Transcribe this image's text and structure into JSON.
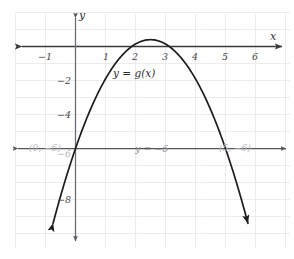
{
  "figure": {
    "background_color": "#ffffff",
    "width": 294,
    "height": 259
  },
  "axes": {
    "x_axis_name": "x",
    "y_axis_name": "y",
    "x_ticks": [
      {
        "value": -1,
        "label": "−1"
      },
      {
        "value": 1,
        "label": "1"
      },
      {
        "value": 2,
        "label": "2"
      },
      {
        "value": 3,
        "label": "3"
      },
      {
        "value": 4,
        "label": "4"
      },
      {
        "value": 5,
        "label": "5"
      },
      {
        "value": 6,
        "label": "6"
      }
    ],
    "y_ticks": [
      {
        "value": -2,
        "label": "−2"
      },
      {
        "value": -4,
        "label": "−4"
      },
      {
        "value": -6,
        "label": "−6"
      },
      {
        "value": -8,
        "label": "−8"
      }
    ],
    "axis_color": "#3a3a3e",
    "grid_color": "#ece8ea"
  },
  "labels": {
    "curve": "y = g(x)",
    "horizontal_line": "y = −6",
    "left_intersection": "(0, −6)",
    "right_intersection": "(5, −6)"
  },
  "chart_data": {
    "type": "line",
    "title": "",
    "xlabel": "x",
    "ylabel": "y",
    "xlim": [
      -1.9,
      7.1
    ],
    "ylim": [
      -10.4,
      1.6
    ],
    "grid": true,
    "legend": "none",
    "series": [
      {
        "name": "y = g(x)",
        "kind": "parabola",
        "equation": "y = -0.96(x - 2.5)^2 + 0.4",
        "vertex": [
          2.5,
          0.4
        ],
        "roots_at_y_minus_6": [
          0,
          5
        ],
        "opens": "down",
        "color": "#1d1d1f",
        "arrow_ends": "both",
        "points": [
          {
            "x": 0.0,
            "y": -6.0
          },
          {
            "x": 0.5,
            "y": -3.44
          },
          {
            "x": 1.0,
            "y": -1.76
          },
          {
            "x": 1.5,
            "y": -0.56
          },
          {
            "x": 2.0,
            "y": 0.16
          },
          {
            "x": 2.5,
            "y": 0.4
          },
          {
            "x": 3.0,
            "y": 0.16
          },
          {
            "x": 3.5,
            "y": -0.56
          },
          {
            "x": 4.0,
            "y": -1.76
          },
          {
            "x": 4.5,
            "y": -3.44
          },
          {
            "x": 5.0,
            "y": -6.0
          },
          {
            "x": 5.5,
            "y": -8.24
          },
          {
            "x": 5.9,
            "y": -10.3
          }
        ]
      },
      {
        "name": "y = −6",
        "kind": "horizontal-line",
        "y": -6,
        "color": "#55555a",
        "arrow_ends": "both"
      }
    ],
    "annotations": [
      {
        "text": "y = g(x)",
        "x": 2.55,
        "y": -1.1
      },
      {
        "text": "y = −6",
        "x": 2.6,
        "y": -5.3
      },
      {
        "text": "(0, −6)",
        "x": 0.05,
        "y": -5.3
      },
      {
        "text": "(5, −6)",
        "x": 5.15,
        "y": -5.3
      }
    ]
  }
}
